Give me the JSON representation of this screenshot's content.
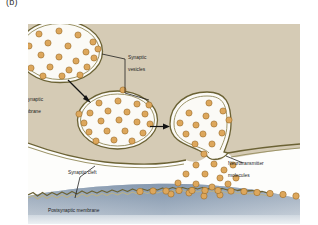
{
  "figure": {
    "panel_label": "(b)",
    "title_semantic": "synaptic-transmission-diagram"
  },
  "labels": {
    "synaptic_vesicles_line1": "Synaptic",
    "synaptic_vesicles_line2": "vesicles",
    "presynaptic_membrane_line1": "Presynaptic",
    "presynaptic_membrane_line2": "membrane",
    "synaptic_cleft": "Synaptic cleft",
    "neurotransmitter_line1": "Neurotransmitter",
    "neurotransmitter_line2": "molecules",
    "postsynaptic_membrane": "Postsynaptic membrane"
  },
  "colors": {
    "presynaptic_cytoplasm": "#d4caб3",
    "presynaptic_cytoplasm_hex": "#d5cbb5",
    "membrane_outline": "#6b6234",
    "vesicle_fill": "#fbfaf6",
    "neurotransmitter_fill": "#dda75c",
    "neurotransmitter_outline": "#9a6b29",
    "synaptic_cleft_fill": "#fdfdfc",
    "postsynaptic_cell": "#8fa0b4",
    "label_text": "#1d1d1d",
    "leader_line": "#1a1a1a",
    "page_background": "#ffffff"
  },
  "structures": {
    "vesicle_1": {
      "name": "free-synaptic-vesicle-upper-left",
      "cx": 120,
      "cy": 103,
      "rx": 85,
      "ry": 62,
      "vesicle_count": 21
    },
    "vesicle_2": {
      "name": "docking-synaptic-vesicle-middle",
      "cx": 235,
      "cy": 240,
      "rx": 80,
      "ry": 58,
      "vesicle_count": 22
    },
    "vesicle_3": {
      "name": "fusing-synaptic-vesicle-right",
      "cx": 390,
      "cy": 255,
      "rx": 65,
      "ry": 62,
      "vesicle_count": 14
    },
    "released_molecule_count": 16,
    "bound_receptor_molecule_count": 13
  },
  "arrows": [
    {
      "name": "arrow-vesicle1-to-vesicle2",
      "from_x": 140,
      "from_y": 165,
      "to_x": 182,
      "to_y": 205
    },
    {
      "name": "arrow-vesicle2-to-vesicle3",
      "from_x": 305,
      "from_y": 253,
      "to_x": 338,
      "to_y": 253
    }
  ]
}
